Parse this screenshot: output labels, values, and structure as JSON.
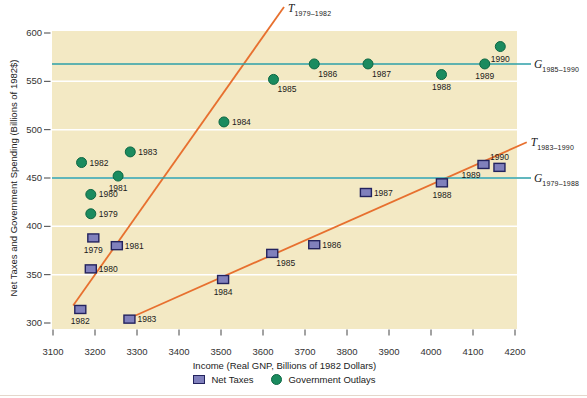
{
  "chart_data": {
    "type": "scatter",
    "title": "",
    "xlabel": "Income (Real GNP, Billions of 1982 Dollars)",
    "ylabel": "Net Taxes and Government Spending (Billions of 1982$)",
    "xlim": [
      3100,
      4200
    ],
    "ylim": [
      300,
      600
    ],
    "x_ticks": [
      3100,
      3200,
      3300,
      3400,
      3500,
      3600,
      3700,
      3800,
      3900,
      4000,
      4100,
      4200
    ],
    "y_ticks": [
      300,
      350,
      400,
      450,
      500,
      550,
      600
    ],
    "gridlines": [
      350,
      400,
      450,
      500,
      550
    ],
    "grid": "horizontal-white",
    "legend_position": "bottom-center",
    "colors": {
      "plot_bg": "#F3E9C4",
      "net_taxes_fill": "#8080BC",
      "net_taxes_border": "#23235E",
      "outlays_fill": "#1B8B5F",
      "outlays_border": "#0D6743",
      "tax_trend_line": "#E7702F",
      "spending_line": "#2C9FA8",
      "gridline": "#FFFFFF",
      "tick": "#444444",
      "text": "#222222"
    },
    "series": [
      {
        "name": "Net Taxes",
        "id": "net-taxes",
        "marker": "square",
        "points": [
          {
            "year": "1979",
            "x": 3196,
            "y": 388,
            "lp": "b"
          },
          {
            "year": "1980",
            "x": 3190,
            "y": 356,
            "lp": "r"
          },
          {
            "year": "1981",
            "x": 3252,
            "y": 380,
            "lp": "r"
          },
          {
            "year": "1982",
            "x": 3165,
            "y": 314,
            "lp": "b"
          },
          {
            "year": "1983",
            "x": 3282,
            "y": 304,
            "lp": "r"
          },
          {
            "year": "1984",
            "x": 3505,
            "y": 345,
            "lp": "b"
          },
          {
            "year": "1985",
            "x": 3622,
            "y": 372,
            "lp": "br"
          },
          {
            "year": "1986",
            "x": 3722,
            "y": 381,
            "lp": "r"
          },
          {
            "year": "1987",
            "x": 3845,
            "y": 435,
            "lp": "r"
          },
          {
            "year": "1988",
            "x": 4026,
            "y": 445,
            "lp": "b"
          },
          {
            "year": "1989",
            "x": 4125,
            "y": 464,
            "lp": "bl"
          },
          {
            "year": "1990",
            "x": 4163,
            "y": 461,
            "lp": "a"
          }
        ]
      },
      {
        "name": "Government Outlays",
        "id": "government-outlays",
        "marker": "circle",
        "points": [
          {
            "year": "1979",
            "x": 3190,
            "y": 413,
            "lp": "r"
          },
          {
            "year": "1980",
            "x": 3190,
            "y": 433,
            "lp": "r"
          },
          {
            "year": "1981",
            "x": 3255,
            "y": 452,
            "lp": "b"
          },
          {
            "year": "1982",
            "x": 3168,
            "y": 466,
            "lp": "r"
          },
          {
            "year": "1983",
            "x": 3284,
            "y": 477,
            "lp": "r"
          },
          {
            "year": "1984",
            "x": 3507,
            "y": 508,
            "lp": "r"
          },
          {
            "year": "1985",
            "x": 3625,
            "y": 552,
            "lp": "br"
          },
          {
            "year": "1986",
            "x": 3722,
            "y": 568,
            "lp": "br"
          },
          {
            "year": "1987",
            "x": 3850,
            "y": 568,
            "lp": "br"
          },
          {
            "year": "1988",
            "x": 4025,
            "y": 557,
            "lp": "b"
          },
          {
            "year": "1989",
            "x": 4128,
            "y": 568,
            "lp": "b"
          },
          {
            "year": "1990",
            "x": 4165,
            "y": 586,
            "lp": "b"
          }
        ]
      }
    ],
    "lines": [
      {
        "id": "T-1979-1982",
        "letter": "T",
        "sub": "1979–1982",
        "kind": "trend",
        "x1": 3148,
        "y1": 318,
        "x2": 3650,
        "y2": 627,
        "color": "#E7702F"
      },
      {
        "id": "T-1983-1990",
        "letter": "T",
        "sub": "1983–1990",
        "kind": "trend",
        "x1": 3287,
        "y1": 306,
        "x2": 4228,
        "y2": 487,
        "color": "#E7702F"
      },
      {
        "id": "G-1985-1990",
        "letter": "G",
        "sub": "1985–1990",
        "kind": "horizontal",
        "value": 568,
        "color": "#2C9FA8"
      },
      {
        "id": "G-1979-1988",
        "letter": "G",
        "sub": "1979–1988",
        "kind": "horizontal",
        "value": 450,
        "color": "#2C9FA8"
      }
    ]
  }
}
